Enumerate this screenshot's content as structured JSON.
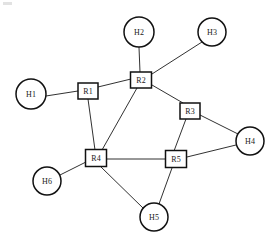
{
  "diagram": {
    "background_color": "#ffffff",
    "line_color": "#1a1a1a",
    "node_fill": "#ffffff",
    "node_stroke": "#111111"
  },
  "nodes": {
    "hosts": [
      {
        "id": "H1",
        "label": "H1",
        "shape": "circle",
        "cx": 31,
        "cy": 94,
        "r": 15
      },
      {
        "id": "H2",
        "label": "H2",
        "shape": "circle",
        "cx": 139,
        "cy": 32,
        "r": 15
      },
      {
        "id": "H3",
        "label": "H3",
        "shape": "circle",
        "cx": 212,
        "cy": 32,
        "r": 14
      },
      {
        "id": "H4",
        "label": "H4",
        "shape": "circle",
        "cx": 250,
        "cy": 141,
        "r": 14
      },
      {
        "id": "H5",
        "label": "H5",
        "shape": "circle",
        "cx": 154,
        "cy": 217,
        "r": 14
      },
      {
        "id": "H6",
        "label": "H6",
        "shape": "circle",
        "cx": 47,
        "cy": 181,
        "r": 14
      }
    ],
    "routers": [
      {
        "id": "R1",
        "label": "R1",
        "shape": "rect",
        "cx": 88,
        "cy": 91,
        "w": 20,
        "h": 16
      },
      {
        "id": "R2",
        "label": "R2",
        "shape": "rect",
        "cx": 141,
        "cy": 80,
        "w": 21,
        "h": 16
      },
      {
        "id": "R3",
        "label": "R3",
        "shape": "rect",
        "cx": 190,
        "cy": 111,
        "w": 20,
        "h": 16
      },
      {
        "id": "R4",
        "label": "R4",
        "shape": "rect",
        "cx": 96,
        "cy": 158,
        "w": 21,
        "h": 17
      },
      {
        "id": "R5",
        "label": "R5",
        "shape": "rect",
        "cx": 176,
        "cy": 159,
        "w": 21,
        "h": 17
      }
    ]
  },
  "edges": [
    {
      "id": "H1-R1",
      "from": "H1",
      "to": "R1",
      "x1": 46,
      "y1": 96,
      "x2": 78,
      "y2": 91
    },
    {
      "id": "R1-R2",
      "from": "R1",
      "to": "R2",
      "x1": 98,
      "y1": 87,
      "x2": 131,
      "y2": 79
    },
    {
      "id": "R1-R4",
      "from": "R1",
      "to": "R4",
      "x1": 88,
      "y1": 99,
      "x2": 95,
      "y2": 150
    },
    {
      "id": "H2-R2",
      "from": "H2",
      "to": "R2",
      "x1": 139,
      "y1": 47,
      "x2": 140,
      "y2": 72
    },
    {
      "id": "R2-H3",
      "from": "R2",
      "to": "H3",
      "x1": 152,
      "y1": 74,
      "x2": 202,
      "y2": 42
    },
    {
      "id": "R2-R3",
      "from": "R2",
      "to": "R3",
      "x1": 152,
      "y1": 85,
      "x2": 183,
      "y2": 103
    },
    {
      "id": "R2-R4",
      "from": "R2",
      "to": "R4",
      "x1": 137,
      "y1": 88,
      "x2": 102,
      "y2": 150
    },
    {
      "id": "R3-H4",
      "from": "R3",
      "to": "H4",
      "x1": 200,
      "y1": 115,
      "x2": 238,
      "y2": 134
    },
    {
      "id": "R3-R5",
      "from": "R3",
      "to": "R5",
      "x1": 186,
      "y1": 119,
      "x2": 174,
      "y2": 151
    },
    {
      "id": "R4-R5",
      "from": "R4",
      "to": "R5",
      "x1": 107,
      "y1": 159,
      "x2": 166,
      "y2": 159
    },
    {
      "id": "R4-H6",
      "from": "R4",
      "to": "H6",
      "x1": 86,
      "y1": 162,
      "x2": 60,
      "y2": 175
    },
    {
      "id": "R4-H5",
      "from": "R4",
      "to": "H5",
      "x1": 101,
      "y1": 167,
      "x2": 143,
      "y2": 208
    },
    {
      "id": "R5-H5",
      "from": "R5",
      "to": "H5",
      "x1": 172,
      "y1": 168,
      "x2": 159,
      "y2": 204
    },
    {
      "id": "R5-H4",
      "from": "R5",
      "to": "H4",
      "x1": 187,
      "y1": 157,
      "x2": 236,
      "y2": 145
    }
  ]
}
